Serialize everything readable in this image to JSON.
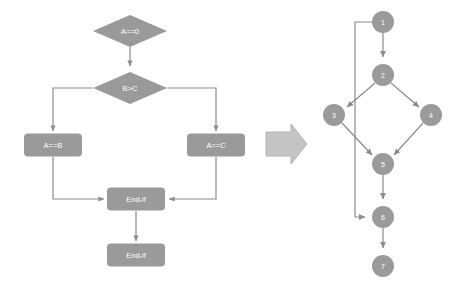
{
  "diagram": {
    "style": {
      "shape_fill": "#9a9a9a",
      "shape_text": "#ffffff",
      "edge_stroke": "#8c8c8c",
      "background": "#ffffff",
      "arrow_fill": "#c4c4c4",
      "arrow_stroke": "#b0b0b0"
    },
    "flowchart": {
      "name": "flowchart",
      "nodes": [
        {
          "id": "fc-a-eq-0",
          "label": "A==0",
          "shape": "diamond",
          "cx": 130,
          "cy": 31,
          "w": 74,
          "h": 32
        },
        {
          "id": "fc-b-gt-c",
          "label": "B>C",
          "shape": "diamond",
          "cx": 130,
          "cy": 88,
          "w": 74,
          "h": 32
        },
        {
          "id": "fc-a-eq-b",
          "label": "A==B",
          "shape": "rect",
          "cx": 53,
          "cy": 145,
          "w": 58,
          "h": 23
        },
        {
          "id": "fc-a-eq-c",
          "label": "A==C",
          "shape": "rect",
          "cx": 216,
          "cy": 145,
          "w": 58,
          "h": 23
        },
        {
          "id": "fc-end-if-1",
          "label": "End-if",
          "shape": "rect",
          "cx": 136,
          "cy": 199,
          "w": 58,
          "h": 23
        },
        {
          "id": "fc-end-if-2",
          "label": "End-if",
          "shape": "rect",
          "cx": 136,
          "cy": 255,
          "w": 58,
          "h": 23
        }
      ],
      "edges": [
        {
          "from": "fc-a-eq-0",
          "to": "fc-b-gt-c"
        },
        {
          "from": "fc-b-gt-c",
          "to": "fc-a-eq-b"
        },
        {
          "from": "fc-b-gt-c",
          "to": "fc-a-eq-c"
        },
        {
          "from": "fc-a-eq-b",
          "to": "fc-end-if-1"
        },
        {
          "from": "fc-a-eq-c",
          "to": "fc-end-if-1"
        },
        {
          "from": "fc-end-if-1",
          "to": "fc-end-if-2"
        }
      ]
    },
    "transform_arrow": {
      "name": "transform-arrow",
      "direction": "right"
    },
    "control_flow_graph": {
      "name": "control-flow-graph",
      "nodes": [
        {
          "id": "n1",
          "label": "1",
          "cx": 383,
          "cy": 22,
          "r": 11
        },
        {
          "id": "n2",
          "label": "2",
          "cx": 383,
          "cy": 75,
          "r": 11
        },
        {
          "id": "n3",
          "label": "3",
          "cx": 334,
          "cy": 115,
          "r": 11
        },
        {
          "id": "n4",
          "label": "4",
          "cx": 431,
          "cy": 115,
          "r": 11
        },
        {
          "id": "n5",
          "label": "5",
          "cx": 383,
          "cy": 164,
          "r": 11
        },
        {
          "id": "n6",
          "label": "6",
          "cx": 383,
          "cy": 217,
          "r": 11
        },
        {
          "id": "n7",
          "label": "7",
          "cx": 383,
          "cy": 266,
          "r": 11
        }
      ],
      "edges": [
        {
          "from": "n1",
          "to": "n2",
          "routing": "straight"
        },
        {
          "from": "n1",
          "to": "n6",
          "routing": "left-bypass"
        },
        {
          "from": "n2",
          "to": "n3",
          "routing": "straight"
        },
        {
          "from": "n2",
          "to": "n4",
          "routing": "straight"
        },
        {
          "from": "n3",
          "to": "n5",
          "routing": "straight"
        },
        {
          "from": "n4",
          "to": "n5",
          "routing": "straight"
        },
        {
          "from": "n5",
          "to": "n6",
          "routing": "straight"
        },
        {
          "from": "n6",
          "to": "n7",
          "routing": "straight"
        }
      ]
    }
  }
}
